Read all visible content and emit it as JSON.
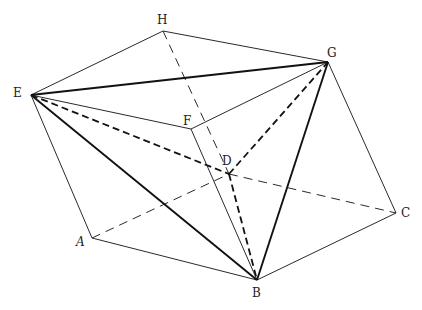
{
  "diagram": {
    "type": "polyhedron-with-inscribed-tetrahedron",
    "colors": {
      "line": "#2a2a2a",
      "thick_line": "#111111",
      "background": "#ffffff"
    },
    "vertices": {
      "A": {
        "label": "A",
        "x": 92,
        "y": 238,
        "lx": 76,
        "ly": 246,
        "italic": true
      },
      "B": {
        "label": "B",
        "x": 257,
        "y": 280,
        "lx": 252,
        "ly": 297
      },
      "C": {
        "label": "C",
        "x": 396,
        "y": 213,
        "lx": 401,
        "ly": 217
      },
      "D": {
        "label": "D",
        "x": 229,
        "y": 174,
        "lx": 222,
        "ly": 165
      },
      "E": {
        "label": "E",
        "x": 31,
        "y": 95,
        "lx": 13,
        "ly": 97
      },
      "F": {
        "label": "F",
        "x": 191,
        "y": 129,
        "lx": 183,
        "ly": 125
      },
      "G": {
        "label": "G",
        "x": 328,
        "y": 62,
        "lx": 327,
        "ly": 57
      },
      "H": {
        "label": "H",
        "x": 163,
        "y": 31,
        "lx": 157,
        "ly": 24
      }
    },
    "edges": {
      "solid_thin": [
        [
          "E",
          "H"
        ],
        [
          "H",
          "G"
        ],
        [
          "E",
          "F"
        ],
        [
          "F",
          "G"
        ],
        [
          "E",
          "A"
        ],
        [
          "A",
          "B"
        ],
        [
          "B",
          "C"
        ],
        [
          "C",
          "G"
        ],
        [
          "F",
          "B"
        ]
      ],
      "solid_thick": [
        [
          "E",
          "G"
        ],
        [
          "E",
          "B"
        ],
        [
          "G",
          "B"
        ]
      ],
      "dashed_thin": [
        [
          "H",
          "D"
        ],
        [
          "A",
          "D"
        ],
        [
          "D",
          "C"
        ]
      ],
      "dashed_thick": [
        [
          "E",
          "D"
        ],
        [
          "D",
          "G"
        ],
        [
          "D",
          "B"
        ]
      ]
    }
  }
}
